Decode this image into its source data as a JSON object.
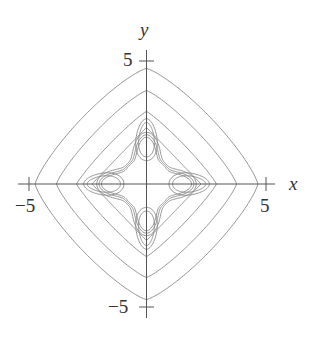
{
  "chart_data": {
    "type": "contour",
    "title": "",
    "xlabel": "x",
    "ylabel": "y",
    "xlim": [
      -5,
      5
    ],
    "ylim": [
      -5,
      5
    ],
    "grid": false,
    "legend": null,
    "x_ticks": [
      {
        "value": -5,
        "label": "−5"
      },
      {
        "value": 5,
        "label": "5"
      }
    ],
    "y_ticks": [
      {
        "value": 5,
        "label": "5"
      },
      {
        "value": -5,
        "label": "−5"
      }
    ],
    "outer_contours_axis_crossings": [
      4.7,
      3.8,
      2.95,
      2.3
    ],
    "inner_contour_axis_crossings": [
      2.1,
      2.0,
      1.9
    ],
    "lobes": [
      {
        "center": [
          0,
          1.8
        ],
        "orientation": "vertical",
        "nested_curves": 2
      },
      {
        "center": [
          0,
          -1.8
        ],
        "orientation": "vertical",
        "nested_curves": 2
      },
      {
        "center": [
          -1.8,
          0
        ],
        "orientation": "horizontal",
        "nested_curves": 2
      },
      {
        "center": [
          1.8,
          0
        ],
        "orientation": "horizontal",
        "nested_curves": 2
      }
    ],
    "shape_description": "Concentric rounded-diamond (4-fold symmetric) level curves surrounding four small elliptical lobes on the axes at distance ~1.8 from origin"
  },
  "labels": {
    "x_axis": "x",
    "y_axis": "y",
    "x_tick_neg": "−5",
    "x_tick_pos": "5",
    "y_tick_pos": "5",
    "y_tick_neg": "−5"
  }
}
